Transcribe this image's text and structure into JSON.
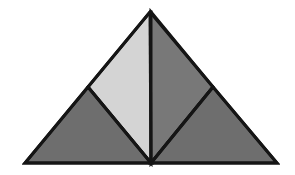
{
  "figure": {
    "background_color": "#ffffff",
    "stroke_color": "#151515",
    "stroke_width": 3,
    "canvas": {
      "width": 295,
      "height": 175
    },
    "vertices": {
      "apex": {
        "name": "apex",
        "x": 150,
        "y": 12
      },
      "left_corner": {
        "name": "left-base-corner",
        "x": 25,
        "y": 163
      },
      "right_corner": {
        "name": "right-base-corner",
        "x": 277,
        "y": 163
      },
      "base_center": {
        "name": "base-midpoint",
        "x": 151,
        "y": 163
      },
      "left_mid": {
        "name": "left-side-midpoint",
        "x": 88,
        "y": 87
      },
      "right_mid": {
        "name": "right-side-midpoint",
        "x": 213,
        "y": 87
      }
    },
    "regions": [
      {
        "id": "upper-left-region",
        "label": "upper left quadrilateral",
        "fill": "#d4d4d4",
        "points": "150,12 88,87 151,163 151,12"
      },
      {
        "id": "upper-right-region",
        "label": "upper right quadrilateral",
        "fill": "#787878",
        "points": "151,12 151,163 213,87"
      },
      {
        "id": "lower-left-region",
        "label": "lower left triangle",
        "fill": "#6e6e6e",
        "points": "88,87 25,163 151,163"
      },
      {
        "id": "lower-right-region",
        "label": "lower right triangle",
        "fill": "#6e6e6e",
        "points": "213,87 151,163 277,163"
      }
    ],
    "outline": {
      "id": "triangle-outline",
      "label": "outer triangle boundary",
      "points": "150,12 277,163 25,163"
    },
    "internal_lines": [
      {
        "id": "vertical-median",
        "label": "apex to base midpoint",
        "x1": 150,
        "y1": 12,
        "x2": 151,
        "y2": 163
      },
      {
        "id": "left-diagonal",
        "label": "left side midpoint to base midpoint",
        "x1": 88,
        "y1": 87,
        "x2": 151,
        "y2": 163
      },
      {
        "id": "right-diagonal",
        "label": "right side midpoint to base midpoint",
        "x1": 213,
        "y1": 87,
        "x2": 151,
        "y2": 163
      }
    ]
  }
}
